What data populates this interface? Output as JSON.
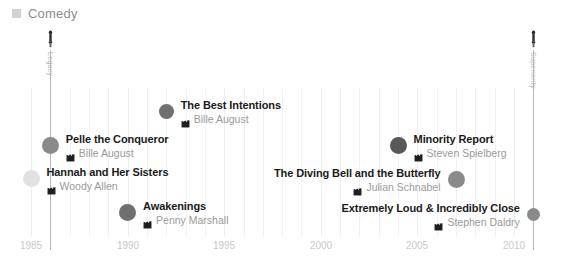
{
  "legend": {
    "swatch_color": "#d2d2d2",
    "label": "Comedy"
  },
  "chart_data": {
    "type": "scatter",
    "title": "",
    "xlabel": "",
    "ylabel": "",
    "xlim": [
      1984,
      2012
    ],
    "grid": true,
    "legend_position": "top-left",
    "legend_entries": [
      "Comedy"
    ],
    "xticks": [
      "1985",
      "1990",
      "1995",
      "2000",
      "2005",
      "2010"
    ],
    "award_axes": [
      {
        "label": "Legacy",
        "year": 1986
      },
      {
        "label": "Superiority",
        "year": 2011
      }
    ],
    "points": [
      {
        "title": "The Best Intentions",
        "director": "Bille August",
        "year": 1992,
        "label_side": "right",
        "dot_color": "#707070",
        "dot_size": 15
      },
      {
        "title": "Pelle the Conqueror",
        "director": "Bille August",
        "year": 1986,
        "label_side": "right",
        "dot_color": "#8a8a8a",
        "dot_size": 17
      },
      {
        "title": "Hannah and Her Sisters",
        "director": "Woody Allen",
        "year": 1985,
        "label_side": "right",
        "dot_color": "#e2e2e2",
        "dot_size": 17
      },
      {
        "title": "Awakenings",
        "director": "Penny Marshall",
        "year": 1990,
        "label_side": "right",
        "dot_color": "#707070",
        "dot_size": 17
      },
      {
        "title": "Minority Report",
        "director": "Steven Spielberg",
        "year": 2004,
        "label_side": "right",
        "dot_color": "#595959",
        "dot_size": 17
      },
      {
        "title": "The Diving Bell and the Butterfly",
        "director": "Julian Schnabel",
        "year": 2007,
        "label_side": "left",
        "dot_color": "#8a8a8a",
        "dot_size": 17
      },
      {
        "title": "Extremely Loud & Incredibly Close",
        "director": "Stephen Daldry",
        "year": 2011,
        "label_side": "left",
        "dot_color": "#8a8a8a",
        "dot_size": 13
      }
    ]
  }
}
